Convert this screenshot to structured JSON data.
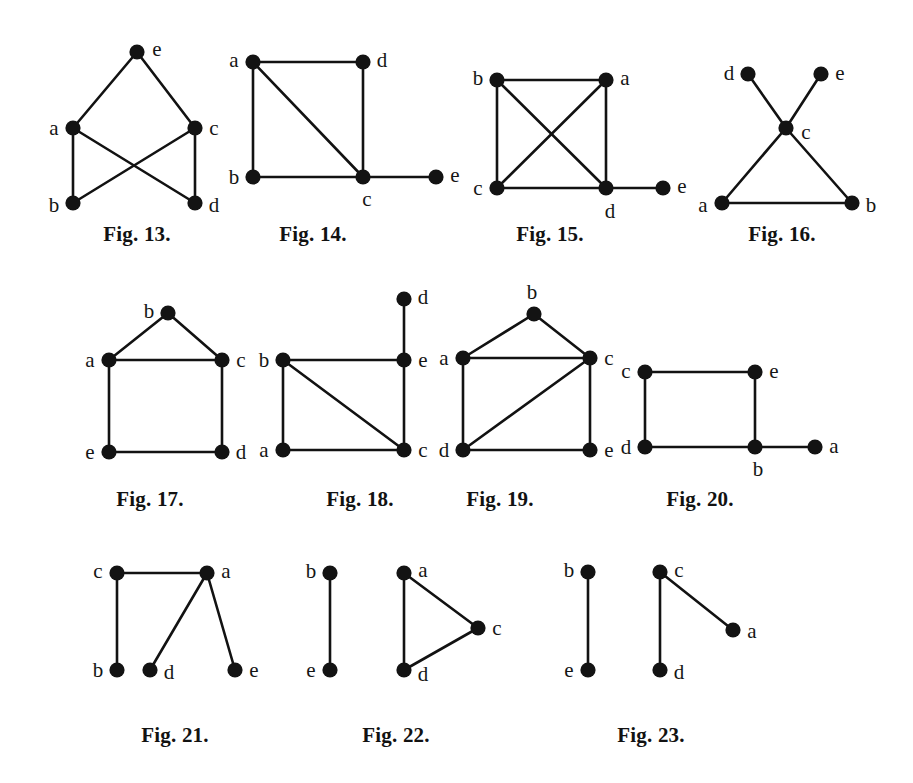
{
  "page": {
    "background_color": "#ffffff",
    "ink_color": "#121212",
    "width": 913,
    "height": 783
  },
  "figures": [
    {
      "id": "fig-13",
      "caption": "Fig. 13.",
      "caption_pos": [
        137,
        234
      ],
      "vertices": [
        {
          "name": "e",
          "x": 137,
          "y": 52,
          "label_dx": 20,
          "label_dy": -3
        },
        {
          "name": "a",
          "x": 73,
          "y": 128,
          "label_dx": -19,
          "label_dy": 0
        },
        {
          "name": "c",
          "x": 195,
          "y": 128,
          "label_dx": 19,
          "label_dy": 0
        },
        {
          "name": "b",
          "x": 73,
          "y": 203,
          "label_dx": -19,
          "label_dy": 2
        },
        {
          "name": "d",
          "x": 195,
          "y": 203,
          "label_dx": 19,
          "label_dy": 2
        }
      ],
      "edges": [
        [
          "e",
          "a"
        ],
        [
          "e",
          "c"
        ],
        [
          "a",
          "b"
        ],
        [
          "c",
          "d"
        ],
        [
          "a",
          "d"
        ],
        [
          "c",
          "b"
        ]
      ]
    },
    {
      "id": "fig-14",
      "caption": "Fig. 14.",
      "caption_pos": [
        313,
        234
      ],
      "vertices": [
        {
          "name": "a",
          "x": 253,
          "y": 62,
          "label_dx": -19,
          "label_dy": -2
        },
        {
          "name": "d",
          "x": 363,
          "y": 62,
          "label_dx": 19,
          "label_dy": -2
        },
        {
          "name": "b",
          "x": 253,
          "y": 177,
          "label_dx": -19,
          "label_dy": 0
        },
        {
          "name": "c",
          "x": 363,
          "y": 177,
          "label_dx": 4,
          "label_dy": 22
        },
        {
          "name": "e",
          "x": 436,
          "y": 177,
          "label_dx": 19,
          "label_dy": -2
        }
      ],
      "edges": [
        [
          "a",
          "d"
        ],
        [
          "a",
          "b"
        ],
        [
          "a",
          "c"
        ],
        [
          "d",
          "c"
        ],
        [
          "b",
          "c"
        ],
        [
          "c",
          "e"
        ]
      ]
    },
    {
      "id": "fig-15",
      "caption": "Fig. 15.",
      "caption_pos": [
        550,
        234
      ],
      "vertices": [
        {
          "name": "b",
          "x": 497,
          "y": 80,
          "label_dx": -19,
          "label_dy": -2
        },
        {
          "name": "a",
          "x": 606,
          "y": 80,
          "label_dx": 19,
          "label_dy": -2
        },
        {
          "name": "c",
          "x": 497,
          "y": 188,
          "label_dx": -19,
          "label_dy": 0
        },
        {
          "name": "d",
          "x": 606,
          "y": 188,
          "label_dx": 4,
          "label_dy": 23
        },
        {
          "name": "e",
          "x": 663,
          "y": 188,
          "label_dx": 19,
          "label_dy": -2
        }
      ],
      "edges": [
        [
          "b",
          "a"
        ],
        [
          "b",
          "c"
        ],
        [
          "b",
          "d"
        ],
        [
          "a",
          "c"
        ],
        [
          "a",
          "d"
        ],
        [
          "c",
          "d"
        ],
        [
          "d",
          "e"
        ]
      ]
    },
    {
      "id": "fig-16",
      "caption": "Fig. 16.",
      "caption_pos": [
        782,
        234
      ],
      "vertices": [
        {
          "name": "d",
          "x": 748,
          "y": 74,
          "label_dx": -19,
          "label_dy": -1
        },
        {
          "name": "e",
          "x": 821,
          "y": 74,
          "label_dx": 19,
          "label_dy": -1
        },
        {
          "name": "c",
          "x": 786,
          "y": 128,
          "label_dx": 20,
          "label_dy": 4
        },
        {
          "name": "a",
          "x": 722,
          "y": 203,
          "label_dx": -19,
          "label_dy": 2
        },
        {
          "name": "b",
          "x": 852,
          "y": 203,
          "label_dx": 19,
          "label_dy": 2
        }
      ],
      "edges": [
        [
          "d",
          "c"
        ],
        [
          "e",
          "c"
        ],
        [
          "c",
          "a"
        ],
        [
          "c",
          "b"
        ],
        [
          "a",
          "b"
        ]
      ]
    },
    {
      "id": "fig-17",
      "caption": "Fig. 17.",
      "caption_pos": [
        150,
        499
      ],
      "vertices": [
        {
          "name": "b",
          "x": 168,
          "y": 313,
          "label_dx": -19,
          "label_dy": -2
        },
        {
          "name": "a",
          "x": 109,
          "y": 360,
          "label_dx": -19,
          "label_dy": 0
        },
        {
          "name": "c",
          "x": 222,
          "y": 360,
          "label_dx": 19,
          "label_dy": 0
        },
        {
          "name": "e",
          "x": 109,
          "y": 452,
          "label_dx": -19,
          "label_dy": 0
        },
        {
          "name": "d",
          "x": 222,
          "y": 452,
          "label_dx": 19,
          "label_dy": 0
        }
      ],
      "edges": [
        [
          "b",
          "a"
        ],
        [
          "b",
          "c"
        ],
        [
          "a",
          "c"
        ],
        [
          "a",
          "e"
        ],
        [
          "c",
          "d"
        ],
        [
          "e",
          "d"
        ]
      ]
    },
    {
      "id": "fig-18",
      "caption": "Fig. 18.",
      "caption_pos": [
        360,
        499
      ],
      "vertices": [
        {
          "name": "d",
          "x": 404,
          "y": 299,
          "label_dx": 19,
          "label_dy": -2
        },
        {
          "name": "b",
          "x": 283,
          "y": 360,
          "label_dx": -19,
          "label_dy": 0
        },
        {
          "name": "e",
          "x": 404,
          "y": 360,
          "label_dx": 19,
          "label_dy": 0
        },
        {
          "name": "a",
          "x": 283,
          "y": 450,
          "label_dx": -19,
          "label_dy": 0
        },
        {
          "name": "c",
          "x": 404,
          "y": 450,
          "label_dx": 19,
          "label_dy": 0
        }
      ],
      "edges": [
        [
          "d",
          "e"
        ],
        [
          "b",
          "e"
        ],
        [
          "b",
          "a"
        ],
        [
          "b",
          "c"
        ],
        [
          "e",
          "c"
        ],
        [
          "a",
          "c"
        ]
      ]
    },
    {
      "id": "fig-19",
      "caption": "Fig. 19.",
      "caption_pos": [
        500,
        499
      ],
      "vertices": [
        {
          "name": "b",
          "x": 534,
          "y": 314,
          "label_dx": -2,
          "label_dy": -22
        },
        {
          "name": "a",
          "x": 463,
          "y": 358,
          "label_dx": -19,
          "label_dy": 0
        },
        {
          "name": "c",
          "x": 590,
          "y": 358,
          "label_dx": 19,
          "label_dy": 0
        },
        {
          "name": "d",
          "x": 463,
          "y": 450,
          "label_dx": -19,
          "label_dy": 0
        },
        {
          "name": "e",
          "x": 590,
          "y": 450,
          "label_dx": 19,
          "label_dy": 0
        }
      ],
      "edges": [
        [
          "b",
          "a"
        ],
        [
          "b",
          "c"
        ],
        [
          "a",
          "c"
        ],
        [
          "a",
          "d"
        ],
        [
          "c",
          "e"
        ],
        [
          "c",
          "d"
        ],
        [
          "d",
          "e"
        ]
      ]
    },
    {
      "id": "fig-20",
      "caption": "Fig. 20.",
      "caption_pos": [
        700,
        499
      ],
      "vertices": [
        {
          "name": "c",
          "x": 645,
          "y": 372,
          "label_dx": -19,
          "label_dy": -1
        },
        {
          "name": "e",
          "x": 755,
          "y": 372,
          "label_dx": 19,
          "label_dy": -1
        },
        {
          "name": "d",
          "x": 645,
          "y": 447,
          "label_dx": -19,
          "label_dy": 0
        },
        {
          "name": "b",
          "x": 755,
          "y": 447,
          "label_dx": 3,
          "label_dy": 22
        },
        {
          "name": "a",
          "x": 815,
          "y": 447,
          "label_dx": 19,
          "label_dy": -1
        }
      ],
      "edges": [
        [
          "c",
          "e"
        ],
        [
          "c",
          "d"
        ],
        [
          "e",
          "b"
        ],
        [
          "d",
          "b"
        ],
        [
          "b",
          "a"
        ]
      ]
    },
    {
      "id": "fig-21",
      "caption": "Fig. 21.",
      "caption_pos": [
        175,
        735
      ],
      "vertices": [
        {
          "name": "c",
          "x": 117,
          "y": 573,
          "label_dx": -19,
          "label_dy": -2
        },
        {
          "name": "a",
          "x": 207,
          "y": 573,
          "label_dx": 19,
          "label_dy": -2
        },
        {
          "name": "b",
          "x": 117,
          "y": 670,
          "label_dx": -19,
          "label_dy": 0
        },
        {
          "name": "d",
          "x": 150,
          "y": 670,
          "label_dx": 19,
          "label_dy": 2
        },
        {
          "name": "e",
          "x": 235,
          "y": 670,
          "label_dx": 19,
          "label_dy": 0
        }
      ],
      "edges": [
        [
          "c",
          "a"
        ],
        [
          "c",
          "b"
        ],
        [
          "a",
          "d"
        ],
        [
          "a",
          "e"
        ]
      ]
    },
    {
      "id": "fig-22",
      "caption": "Fig. 22.",
      "caption_pos": [
        396,
        735
      ],
      "vertices": [
        {
          "name": "b",
          "x": 330,
          "y": 573,
          "label_dx": -19,
          "label_dy": -2
        },
        {
          "name": "e",
          "x": 330,
          "y": 670,
          "label_dx": -19,
          "label_dy": 0
        },
        {
          "name": "a",
          "x": 404,
          "y": 573,
          "label_dx": 19,
          "label_dy": -3
        },
        {
          "name": "c",
          "x": 478,
          "y": 628,
          "label_dx": 19,
          "label_dy": 0
        },
        {
          "name": "d",
          "x": 404,
          "y": 670,
          "label_dx": 19,
          "label_dy": 4
        }
      ],
      "edges": [
        [
          "b",
          "e"
        ],
        [
          "a",
          "c"
        ],
        [
          "a",
          "d"
        ],
        [
          "c",
          "d"
        ]
      ]
    },
    {
      "id": "fig-23",
      "caption": "Fig. 23.",
      "caption_pos": [
        651,
        735
      ],
      "vertices": [
        {
          "name": "b",
          "x": 588,
          "y": 572,
          "label_dx": -19,
          "label_dy": -2
        },
        {
          "name": "e",
          "x": 588,
          "y": 670,
          "label_dx": -19,
          "label_dy": 0
        },
        {
          "name": "c",
          "x": 660,
          "y": 572,
          "label_dx": 19,
          "label_dy": -2
        },
        {
          "name": "d",
          "x": 660,
          "y": 670,
          "label_dx": 19,
          "label_dy": 2
        },
        {
          "name": "a",
          "x": 733,
          "y": 630,
          "label_dx": 19,
          "label_dy": 1
        }
      ],
      "edges": [
        [
          "b",
          "e"
        ],
        [
          "c",
          "d"
        ],
        [
          "c",
          "a"
        ]
      ]
    }
  ]
}
